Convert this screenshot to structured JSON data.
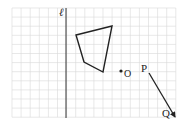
{
  "diagram": {
    "type": "coordinate-grid-transformation",
    "grid": {
      "x0": 12,
      "y0": 8,
      "cell": 9.1,
      "cols": 18,
      "rows": 12,
      "color": "#d9d9d9"
    },
    "line_l": {
      "label": "ℓ",
      "x": 66,
      "y1": 8,
      "y2": 118,
      "color": "#333333"
    },
    "quadrilateral": {
      "points": [
        [
          76,
          35
        ],
        [
          112,
          26
        ],
        [
          103,
          72
        ],
        [
          84,
          62
        ]
      ],
      "color": "#222222"
    },
    "point_O": {
      "label": "O",
      "x": 121,
      "y": 71
    },
    "vector_PQ": {
      "from_label": "P",
      "to_label": "Q",
      "x1": 149,
      "y1": 73,
      "x2": 175,
      "y2": 117,
      "color": "#222222"
    }
  }
}
